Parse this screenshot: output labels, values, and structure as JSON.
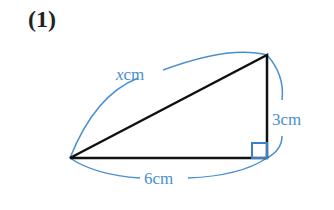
{
  "problem_number": "(1)",
  "labels": {
    "hypotenuse": "xcm",
    "hyp_var": "x",
    "hyp_unit": "cm",
    "vertical": "3cm",
    "horizontal": "6cm"
  },
  "colors": {
    "line": "#111111",
    "annotation": "#4a8fd0"
  }
}
